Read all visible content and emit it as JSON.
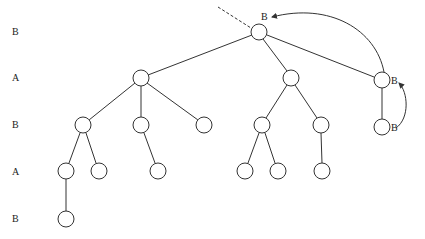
{
  "levels": [
    {
      "label": "B",
      "y": 31
    },
    {
      "label": "A",
      "y": 78
    },
    {
      "label": "B",
      "y": 125
    },
    {
      "label": "A",
      "y": 171
    },
    {
      "label": "B",
      "y": 219
    }
  ],
  "node_labels": {
    "root": "B",
    "right_a": "B",
    "right_b": "B"
  },
  "nodes": [
    {
      "id": "root",
      "x": 259,
      "y": 32
    },
    {
      "id": "a1",
      "x": 141,
      "y": 78
    },
    {
      "id": "a2",
      "x": 291,
      "y": 78
    },
    {
      "id": "a3",
      "x": 382,
      "y": 80
    },
    {
      "id": "b1",
      "x": 83,
      "y": 125
    },
    {
      "id": "b2",
      "x": 141,
      "y": 125
    },
    {
      "id": "b3",
      "x": 204,
      "y": 125
    },
    {
      "id": "b4",
      "x": 262,
      "y": 125
    },
    {
      "id": "b5",
      "x": 321,
      "y": 125
    },
    {
      "id": "b6",
      "x": 382,
      "y": 127
    },
    {
      "id": "c1",
      "x": 66,
      "y": 171
    },
    {
      "id": "c2",
      "x": 99,
      "y": 171
    },
    {
      "id": "c3",
      "x": 158,
      "y": 171
    },
    {
      "id": "c4",
      "x": 245,
      "y": 171
    },
    {
      "id": "c5",
      "x": 278,
      "y": 171
    },
    {
      "id": "c6",
      "x": 322,
      "y": 171
    },
    {
      "id": "d1",
      "x": 66,
      "y": 219
    }
  ]
}
